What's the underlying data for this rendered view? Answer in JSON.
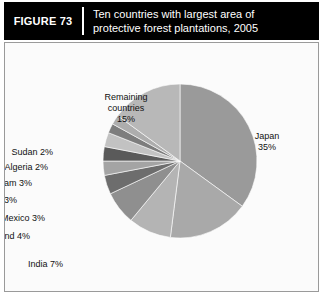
{
  "header": {
    "figure_number": "FIGURE 73",
    "title_line_1": "Ten countries with largest area of",
    "title_line_2": "protective forest plantations, 2005"
  },
  "chart_data": {
    "type": "pie",
    "title": "Ten countries with largest area of protective forest plantations, 2005",
    "xlabel": "",
    "ylabel": "",
    "units": "percent",
    "start_angle_deg": 0,
    "direction": "clockwise",
    "legend_position": "none",
    "grid": false,
    "categories": [
      "Japan",
      "Russian Federation",
      "China",
      "India",
      "Thailand",
      "Mexico",
      "Kazakhstan",
      "Viet Nam",
      "Algeria",
      "Sudan",
      "Remaining countries"
    ],
    "values": [
      35,
      17,
      9,
      7,
      4,
      3,
      3,
      3,
      2,
      2,
      15
    ],
    "slices": [
      {
        "name": "Japan",
        "value": 35,
        "label_line_1": "Japan",
        "label_line_2": "35%",
        "color": "#9a9a9a",
        "label_x": 262,
        "label_y": 88,
        "label_align": "align-center"
      },
      {
        "name": "Russian Federation",
        "value": 17,
        "label_line_1": "Russian",
        "label_line_2": "Federation 17%",
        "color": "#a9a9a9",
        "label_x": 236,
        "label_y": 247,
        "label_align": "align-center"
      },
      {
        "name": "China",
        "value": 9,
        "label_line_1": "China 9%",
        "label_line_2": "",
        "color": "#b4b4b4",
        "label_x": 111,
        "label_y": 254,
        "label_align": "align-left"
      },
      {
        "name": "India",
        "value": 7,
        "label_line_1": "India 7%",
        "label_line_2": "",
        "color": "#8f8f8f",
        "label_x": 58,
        "label_y": 216,
        "label_align": "align-right"
      },
      {
        "name": "Thailand",
        "value": 4,
        "label_line_1": "Thailand 4%",
        "label_line_2": "",
        "color": "#6d6d6d",
        "label_x": 25,
        "label_y": 188,
        "label_align": "align-right"
      },
      {
        "name": "Mexico",
        "value": 3,
        "label_line_1": "Mexico 3%",
        "label_line_2": "",
        "color": "#a4a4a4",
        "label_x": 40,
        "label_y": 170,
        "label_align": "align-right"
      },
      {
        "name": "Kazakhstan",
        "value": 3,
        "label_line_1": "Kazakhstan 3%",
        "label_line_2": "",
        "color": "#5a5a5a",
        "label_x": 12,
        "label_y": 152,
        "label_align": "align-right"
      },
      {
        "name": "Viet Nam",
        "value": 3,
        "label_line_1": "Viet Nam 3%",
        "label_line_2": "",
        "color": "#c2c2c2",
        "label_x": 27,
        "label_y": 135,
        "label_align": "align-right"
      },
      {
        "name": "Algeria",
        "value": 2,
        "label_line_1": "Algeria 2%",
        "label_line_2": "",
        "color": "#7d7d7d",
        "label_x": 43,
        "label_y": 119,
        "label_align": "align-right"
      },
      {
        "name": "Sudan",
        "value": 2,
        "label_line_1": "Sudan 2%",
        "label_line_2": "",
        "color": "#adadad",
        "label_x": 48,
        "label_y": 104,
        "label_align": "align-right"
      },
      {
        "name": "Remaining countries",
        "value": 15,
        "label_line_1": "Remaining",
        "label_line_2": "countries",
        "label_line_3": "15%",
        "color": "#b8b8b8",
        "label_x": 121,
        "label_y": 49,
        "label_align": "align-center"
      }
    ],
    "geometry": {
      "center_x": 175,
      "center_y": 118,
      "radius": 77
    }
  }
}
